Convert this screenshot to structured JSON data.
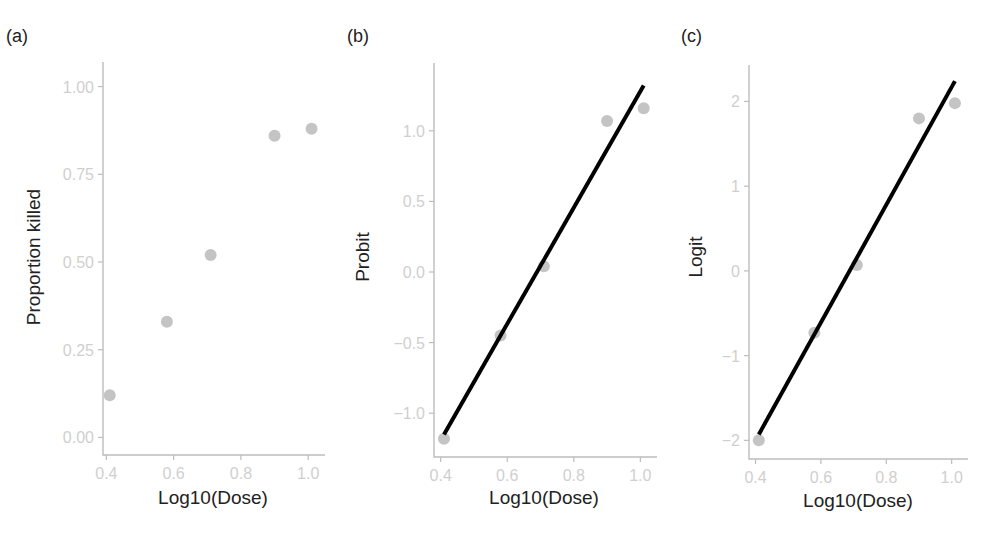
{
  "figure": {
    "panels": [
      {
        "label": "(a)",
        "ylabel": "Proportion killed",
        "xlabel": "Log10(Dose)"
      },
      {
        "label": "(b)",
        "ylabel": "Probit",
        "xlabel": "Log10(Dose)"
      },
      {
        "label": "(c)",
        "ylabel": "Logit",
        "xlabel": "Log10(Dose)"
      }
    ]
  },
  "colors": {
    "points": "#c4c4c4",
    "fit_line": "#000000",
    "axis": "#bdbdbd",
    "tick_labels": "#cfcfcf",
    "titles": "#222222"
  },
  "chart_data": [
    {
      "type": "scatter",
      "panel": "(a)",
      "title": "",
      "xlabel": "Log10(Dose)",
      "ylabel": "Proportion killed",
      "xlim": [
        0.39,
        1.05
      ],
      "ylim": [
        -0.05,
        1.07
      ],
      "xticks": [
        0.4,
        0.6,
        0.8,
        1.0
      ],
      "xtick_labels": [
        "0.4",
        "0.6",
        "0.8",
        "1.0"
      ],
      "yticks": [
        0.0,
        0.25,
        0.5,
        0.75,
        1.0
      ],
      "ytick_labels": [
        "0.00",
        "0.25",
        "0.50",
        "0.75",
        "1.00"
      ],
      "grid": false,
      "x": [
        0.41,
        0.58,
        0.71,
        0.9,
        1.01
      ],
      "y": [
        0.12,
        0.33,
        0.52,
        0.86,
        0.88
      ]
    },
    {
      "type": "scatter",
      "panel": "(b)",
      "title": "",
      "xlabel": "Log10(Dose)",
      "ylabel": "Probit",
      "xlim": [
        0.38,
        1.05
      ],
      "ylim": [
        -1.31,
        1.48
      ],
      "xticks": [
        0.4,
        0.6,
        0.8,
        1.0
      ],
      "xtick_labels": [
        "0.4",
        "0.6",
        "0.8",
        "1.0"
      ],
      "yticks": [
        -1.0,
        -0.5,
        0.0,
        0.5,
        1.0
      ],
      "ytick_labels": [
        "-1.0",
        "-0.5",
        "0.0",
        "0.5",
        "1.0"
      ],
      "grid": false,
      "x": [
        0.41,
        0.58,
        0.71,
        0.9,
        1.01
      ],
      "y": [
        -1.18,
        -0.45,
        0.04,
        1.07,
        1.16
      ],
      "fit_line": {
        "x": [
          0.41,
          1.01
        ],
        "y": [
          -1.15,
          1.32
        ]
      }
    },
    {
      "type": "scatter",
      "panel": "(c)",
      "title": "",
      "xlabel": "Log10(Dose)",
      "ylabel": "Logit",
      "xlim": [
        0.38,
        1.05
      ],
      "ylim": [
        -2.22,
        2.43
      ],
      "xticks": [
        0.4,
        0.6,
        0.8,
        1.0
      ],
      "xtick_labels": [
        "0.4",
        "0.6",
        "0.8",
        "1.0"
      ],
      "yticks": [
        -2,
        -1,
        0,
        1,
        2
      ],
      "ytick_labels": [
        "-2",
        "-1",
        "0",
        "1",
        "2"
      ],
      "grid": false,
      "x": [
        0.41,
        0.58,
        0.71,
        0.9,
        1.01
      ],
      "y": [
        -2.0,
        -0.73,
        0.07,
        1.8,
        1.98
      ],
      "fit_line": {
        "x": [
          0.41,
          1.01
        ],
        "y": [
          -1.93,
          2.24
        ]
      }
    }
  ]
}
